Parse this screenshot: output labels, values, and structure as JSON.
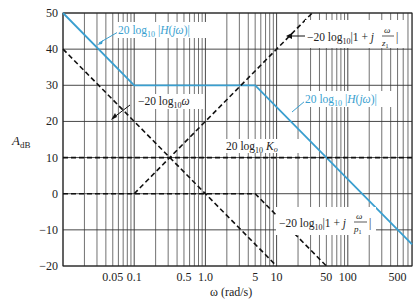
{
  "chart_data": {
    "type": "line",
    "title": "",
    "xlabel": "ω (rad/s)",
    "ylabel": "A_dB",
    "x_scale": "log",
    "xlim": [
      0.01,
      800
    ],
    "ylim": [
      -20,
      50
    ],
    "grid": true,
    "x_tick_labels": [
      "0.05",
      "0.1",
      "0.5",
      "1.0",
      "5",
      "10",
      "50",
      "100",
      "500"
    ],
    "x_tick_values": [
      0.05,
      0.1,
      0.5,
      1,
      5,
      10,
      50,
      100,
      500
    ],
    "y_ticks": [
      50,
      40,
      30,
      20,
      10,
      0,
      -10,
      -20
    ],
    "series": [
      {
        "name": "20 log10 |H(jω)| (total)",
        "style": "solid",
        "color": "#3a9fd0",
        "x": [
          0.01,
          0.1,
          5,
          800
        ],
        "y": [
          50,
          30,
          30,
          -14
        ]
      },
      {
        "name": "−20 log10 ω",
        "style": "dashed",
        "color": "#111111",
        "x": [
          0.01,
          10
        ],
        "y": [
          40,
          -20
        ]
      },
      {
        "name": "20 log10 |1 + jω/z1|",
        "style": "dashed",
        "color": "#111111",
        "x": [
          0.1,
          31.6
        ],
        "y": [
          0,
          50
        ]
      },
      {
        "name": "20 log10 K_o",
        "style": "dashed",
        "color": "#111111",
        "x": [
          0.01,
          800
        ],
        "y": [
          10,
          10
        ]
      },
      {
        "name": "−20 log10 |1 + jω/p1|",
        "style": "dashed",
        "color": "#111111",
        "x": [
          0.01,
          5,
          50
        ],
        "y": [
          0,
          0,
          -20
        ]
      }
    ],
    "annotations": [
      {
        "text": "20 log10 |H(jω)|",
        "position": "upper-left",
        "color": "#3a9fd0"
      },
      {
        "text": "20 log10 |H(jω)|",
        "position": "right-middle",
        "color": "#3a9fd0"
      },
      {
        "text": "−20 log10 ω",
        "position": "left-middle"
      },
      {
        "text": "−20 log10 |1 + j ω/z1|",
        "position": "upper-right"
      },
      {
        "text": "20 log10 K_o",
        "position": "center"
      },
      {
        "text": "−20 log10 |1 + j ω/p1|",
        "position": "lower-right"
      }
    ]
  },
  "labels": {
    "y_axis": "A",
    "y_axis_sub": "dB",
    "x_axis": "ω (rad/s)",
    "h_top": "20 log",
    "h_right": "20 log",
    "neg_omega": "−20 log",
    "zero": "−20 log",
    "ko": "20 log",
    "pole": "−20 log",
    "sub10": "10"
  }
}
